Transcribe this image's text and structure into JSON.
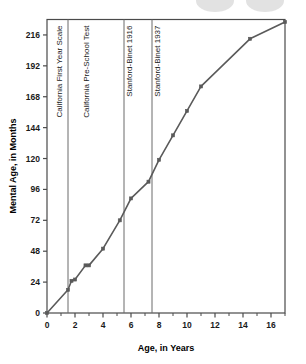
{
  "chart_data": {
    "type": "line",
    "title": "",
    "xlabel": "Age, in Years",
    "ylabel": "Mental Age, in Months",
    "xlim": [
      0,
      17
    ],
    "ylim": [
      0,
      228
    ],
    "grid": false,
    "legend": "none",
    "x_ticks": [
      0,
      2,
      4,
      6,
      8,
      10,
      12,
      14,
      16
    ],
    "x_minor_ticks": [
      1,
      3,
      5,
      7,
      9,
      11,
      13,
      15,
      17
    ],
    "y_ticks": [
      0,
      24,
      48,
      72,
      96,
      120,
      144,
      168,
      192,
      216
    ],
    "series": [
      {
        "name": "Mental Age vs Age",
        "color": "#5a5a5a",
        "marker": "square",
        "points": [
          {
            "x": 0,
            "y": 0
          },
          {
            "x": 1.5,
            "y": 18
          },
          {
            "x": 1.75,
            "y": 25
          },
          {
            "x": 2.0,
            "y": 26
          },
          {
            "x": 2.75,
            "y": 37
          },
          {
            "x": 3.0,
            "y": 37
          },
          {
            "x": 4.0,
            "y": 50
          },
          {
            "x": 5.2,
            "y": 72
          },
          {
            "x": 6.0,
            "y": 89
          },
          {
            "x": 7.25,
            "y": 102
          },
          {
            "x": 8.0,
            "y": 119
          },
          {
            "x": 9.0,
            "y": 138
          },
          {
            "x": 10.0,
            "y": 157
          },
          {
            "x": 11.0,
            "y": 176
          },
          {
            "x": 14.5,
            "y": 213
          },
          {
            "x": 17.0,
            "y": 226
          }
        ]
      }
    ],
    "region_dividers": [
      {
        "x": 1.5
      },
      {
        "x": 5.5
      },
      {
        "x": 7.5
      }
    ],
    "region_labels": [
      {
        "text": "California First Year Scale",
        "x": 1.1
      },
      {
        "text": "California  Pre-School Test",
        "x": 3.0
      },
      {
        "text": "Stanford-Binet 1916",
        "x": 6.1
      },
      {
        "text": "Stanford-Binet 1937",
        "x": 8.1
      }
    ]
  },
  "colors": {
    "line": "#5a5a5a",
    "marker": "#5a5a5a",
    "axis": "#4a4a4a",
    "divider": "#6a6a6a",
    "text": "#111111"
  }
}
